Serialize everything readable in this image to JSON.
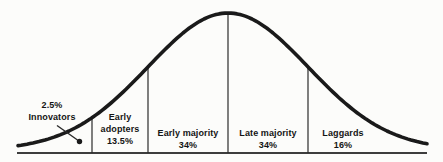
{
  "figure": {
    "bg_color": "#fcfcfa",
    "ink_color": "#1a1a1a"
  },
  "callout": {
    "percent": "2.5%",
    "name": "Innovators"
  },
  "segments": [
    {
      "name": "Early adopters",
      "percent": "13.5%"
    },
    {
      "name": "Early majority",
      "percent": "34%"
    },
    {
      "name": "Late majority",
      "percent": "34%"
    },
    {
      "name": "Laggards",
      "percent": "16%"
    }
  ],
  "chart_data": {
    "type": "area",
    "curve_shape": "normal-distribution-bell",
    "categories": [
      "Innovators",
      "Early adopters",
      "Early majority",
      "Late majority",
      "Laggards"
    ],
    "values_pct": [
      2.5,
      13.5,
      34,
      34,
      16
    ],
    "title": "",
    "xlabel": "",
    "ylabel": "",
    "legend": "none",
    "grid": "off"
  }
}
